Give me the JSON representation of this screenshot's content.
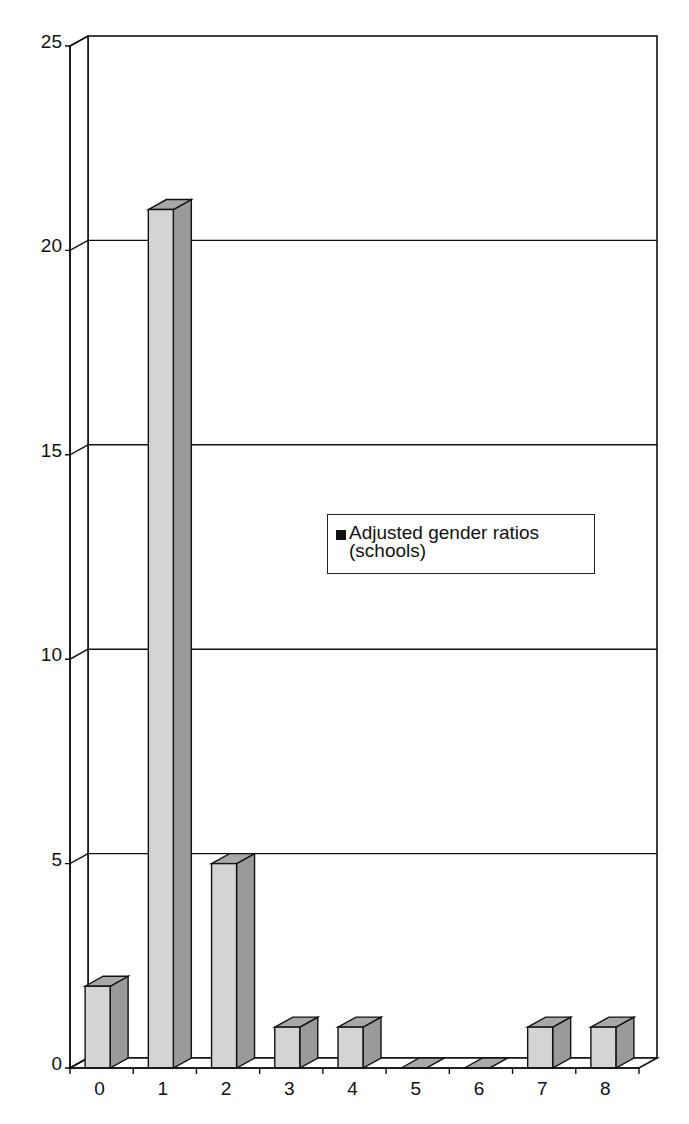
{
  "chart_data": {
    "type": "bar",
    "style": "3d-column",
    "title": "",
    "xlabel": "",
    "ylabel": "",
    "categories": [
      "0",
      "1",
      "2",
      "3",
      "4",
      "5",
      "6",
      "7",
      "8"
    ],
    "series": [
      {
        "name": "Adjusted gender ratios (schools)",
        "values": [
          2,
          21,
          5,
          1,
          1,
          0,
          0,
          1,
          1
        ]
      }
    ],
    "ylim": [
      0,
      25
    ],
    "yticks": [
      0,
      5,
      10,
      15,
      20,
      25
    ],
    "grid": true,
    "legend_position": "inside-right-middle",
    "colors": {
      "bar_front": "#d4d4d4",
      "bar_side": "#9a9a9a",
      "bar_top": "#a8a8a8",
      "axis": "#111111",
      "grid": "#111111"
    }
  },
  "legend": {
    "label_line1": "Adjusted gender ratios",
    "label_line2": "(schools)"
  }
}
